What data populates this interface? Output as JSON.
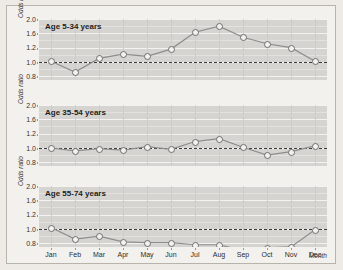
{
  "figure": {
    "background_color": "#f3f1ed",
    "plot_color": "#d6d4d0",
    "line_color": "#8d8d8d",
    "marker_fill": "#f2f1ef",
    "reference_line_value": 1.0,
    "x_axis_title": "Month",
    "y_axis_title": "Odds ratio"
  },
  "chart_data": {
    "type": "line",
    "title": "",
    "xlabel": "Month",
    "ylabel": "Odds ratio",
    "categories": [
      "Jan",
      "Feb",
      "Mar",
      "Apr",
      "May",
      "Jun",
      "Jul",
      "Aug",
      "Sep",
      "Oct",
      "Nov",
      "Dec"
    ],
    "ytick_labels": [
      "2.0",
      "1.6",
      "1.2",
      "1.0",
      "0.8"
    ],
    "ytick_values": [
      2.0,
      1.6,
      1.2,
      1.0,
      0.8
    ],
    "ylim": [
      0.7,
      2.1
    ],
    "grid": true,
    "legend": "none",
    "reference_line": 1.0,
    "panels": [
      {
        "label": "Age 5-34 years",
        "values": [
          1.01,
          0.86,
          1.05,
          1.11,
          1.08,
          1.18,
          1.63,
          1.8,
          1.49,
          1.31,
          1.2,
          1.01
        ]
      },
      {
        "label": "Age 35-54 years",
        "values": [
          1.0,
          0.96,
          0.99,
          0.97,
          1.02,
          0.98,
          1.09,
          1.13,
          1.01,
          0.9,
          0.95,
          1.03
        ]
      },
      {
        "label": "Age 55-74 years",
        "values": [
          1.02,
          0.86,
          0.9,
          0.82,
          0.81,
          0.81,
          0.78,
          0.78,
          0.7,
          0.74,
          0.75,
          0.99
        ]
      }
    ]
  },
  "panels": [
    {
      "title": "Age 5-34 years",
      "y_title": "Odds ratio"
    },
    {
      "title": "Age 35-54 years",
      "y_title": "Odds ratio"
    },
    {
      "title": "Age 55-74 years",
      "y_title": "Odds ratio"
    }
  ],
  "ylabels": [
    "2.0",
    "1.6",
    "1.2",
    "1.0",
    "0.8"
  ],
  "months": [
    "Jan",
    "Feb",
    "Mar",
    "Apr",
    "May",
    "Jun",
    "Jul",
    "Aug",
    "Sep",
    "Oct",
    "Nov",
    "Dec"
  ],
  "xaxis_label": "Month"
}
